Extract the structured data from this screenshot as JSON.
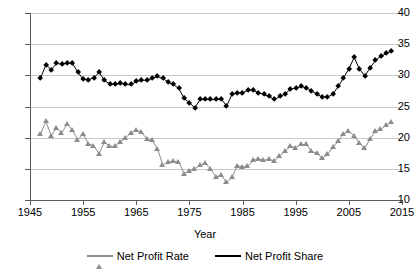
{
  "chart_data": {
    "type": "line",
    "title": "",
    "xlabel": "Year",
    "ylabel": "",
    "xlim": [
      1945,
      2015
    ],
    "ylim": [
      10,
      40
    ],
    "yticks": [
      10,
      15,
      20,
      25,
      30,
      35,
      40
    ],
    "xticks": [
      1945,
      1955,
      1965,
      1975,
      1985,
      1995,
      2005,
      2015
    ],
    "grid": true,
    "legend_position": "bottom",
    "x": [
      1947,
      1948,
      1949,
      1950,
      1951,
      1952,
      1953,
      1954,
      1955,
      1956,
      1957,
      1958,
      1959,
      1960,
      1961,
      1962,
      1963,
      1964,
      1965,
      1966,
      1967,
      1968,
      1969,
      1970,
      1971,
      1972,
      1973,
      1974,
      1975,
      1976,
      1977,
      1978,
      1979,
      1980,
      1981,
      1982,
      1983,
      1984,
      1985,
      1986,
      1987,
      1988,
      1989,
      1990,
      1991,
      1992,
      1993,
      1994,
      1995,
      1996,
      1997,
      1998,
      1999,
      2000,
      2001,
      2002,
      2003,
      2004,
      2005,
      2006,
      2007,
      2008,
      2009,
      2010,
      2011,
      2012,
      2013
    ],
    "series": [
      {
        "name": "Net Profit Rate",
        "color": "#8c8c8c",
        "marker": "triangle",
        "values": [
          20.6,
          22.6,
          20.3,
          21.6,
          20.8,
          22.2,
          21.2,
          19.6,
          20.6,
          19.0,
          18.7,
          17.4,
          19.3,
          18.6,
          18.6,
          19.3,
          20.0,
          20.8,
          21.2,
          20.9,
          19.7,
          19.6,
          18.2,
          15.6,
          16.1,
          16.2,
          16.1,
          14.2,
          14.7,
          15.0,
          15.6,
          15.9,
          15.0,
          13.7,
          14.0,
          12.8,
          13.6,
          15.5,
          15.3,
          15.4,
          16.4,
          16.6,
          16.4,
          16.5,
          16.3,
          17.1,
          17.8,
          18.6,
          18.4,
          18.9,
          18.9,
          17.8,
          17.5,
          16.7,
          17.3,
          18.5,
          19.4,
          20.6,
          21.0,
          20.3,
          19.1,
          18.3,
          19.8,
          21.0,
          21.3,
          22.0,
          22.5
        ]
      },
      {
        "name": "Net Profit Share",
        "color": "#000000",
        "marker": "diamond",
        "values": [
          29.6,
          31.7,
          30.9,
          31.9,
          31.8,
          32.0,
          31.9,
          30.5,
          29.4,
          29.3,
          29.6,
          30.5,
          29.2,
          28.6,
          28.5,
          28.7,
          28.5,
          28.5,
          29.0,
          29.2,
          29.2,
          29.5,
          29.8,
          29.5,
          28.9,
          28.5,
          27.9,
          26.3,
          25.6,
          24.8,
          26.1,
          26.1,
          26.1,
          26.1,
          26.2,
          25.1,
          26.9,
          27.2,
          27.2,
          27.6,
          27.6,
          27.2,
          26.9,
          26.6,
          26.1,
          26.6,
          27.0,
          27.8,
          27.9,
          28.2,
          28.0,
          27.5,
          27.0,
          26.5,
          26.5,
          27.0,
          28.2,
          29.6,
          31.0,
          32.9,
          31.0,
          29.9,
          31.2,
          32.4,
          33.0,
          33.5,
          33.9
        ]
      }
    ]
  },
  "legend": {
    "items": [
      {
        "label": "Net Profit Rate"
      },
      {
        "label": "Net Profit Share"
      }
    ]
  }
}
